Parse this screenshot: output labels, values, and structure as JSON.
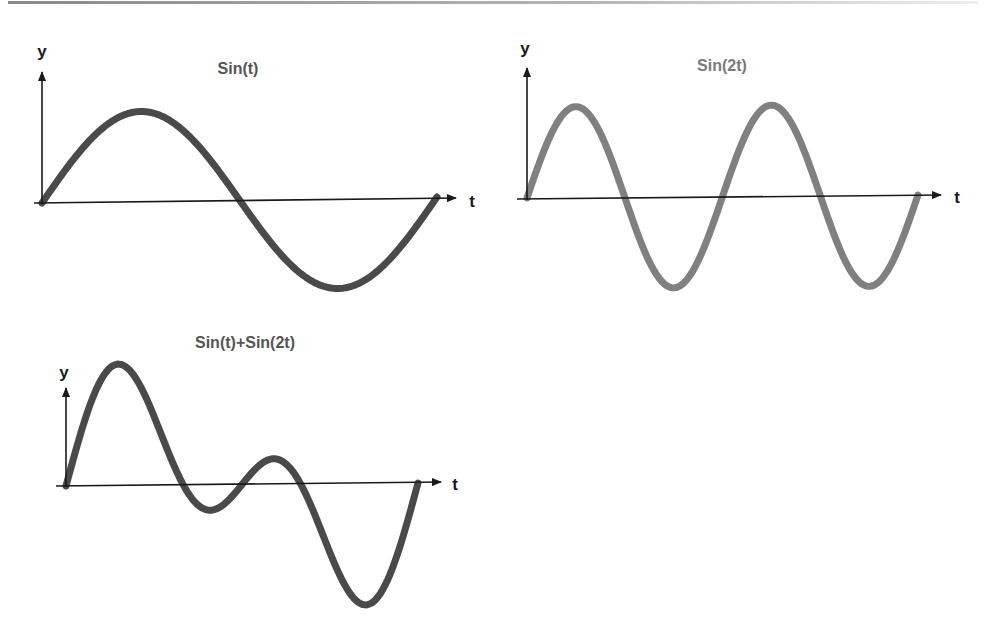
{
  "figure": {
    "panels": [
      {
        "title": "Sin(t)",
        "title_color": "#555555",
        "y_label": "y",
        "x_label": "t",
        "curve_color": "#4a4a4a"
      },
      {
        "title": "Sin(2t)",
        "title_color": "#7a7a7a",
        "y_label": "y",
        "x_label": "t",
        "curve_color": "#808080"
      },
      {
        "title": "Sin(t)+Sin(2t)",
        "title_color": "#555555",
        "y_label": "y",
        "x_label": "t",
        "curve_color": "#4a4a4a"
      }
    ]
  },
  "chart_data": [
    {
      "type": "line",
      "title": "Sin(t)",
      "xlabel": "t",
      "ylabel": "y",
      "function": "sin(t)",
      "x_range": [
        0,
        6.283
      ],
      "x": [
        0,
        0.785,
        1.571,
        2.356,
        3.142,
        3.927,
        4.712,
        5.498,
        6.283
      ],
      "values": [
        0,
        0.71,
        1,
        0.71,
        0,
        -0.71,
        -1,
        -0.71,
        0
      ],
      "ylim": [
        -1,
        1
      ],
      "grid": false,
      "legend": null
    },
    {
      "type": "line",
      "title": "Sin(2t)",
      "xlabel": "t",
      "ylabel": "y",
      "function": "sin(2t)",
      "x_range": [
        0,
        6.283
      ],
      "x": [
        0,
        0.785,
        1.571,
        2.356,
        3.142,
        3.927,
        4.712,
        5.498,
        6.283
      ],
      "values": [
        0,
        1,
        0,
        -1,
        0,
        1,
        0,
        -1,
        0
      ],
      "ylim": [
        -1,
        1
      ],
      "grid": false,
      "legend": null
    },
    {
      "type": "line",
      "title": "Sin(t)+Sin(2t)",
      "xlabel": "t",
      "ylabel": "y",
      "function": "sin(t)+sin(2t)",
      "x_range": [
        0,
        6.283
      ],
      "x": [
        0,
        0.94,
        1.571,
        2.094,
        2.5,
        3.142,
        3.78,
        4.189,
        5.34,
        6.283
      ],
      "values": [
        0,
        1.76,
        1,
        0,
        -0.37,
        0,
        0.37,
        0,
        -1.76,
        0
      ],
      "ylim": [
        -1.76,
        1.76
      ],
      "grid": false,
      "legend": null
    }
  ]
}
